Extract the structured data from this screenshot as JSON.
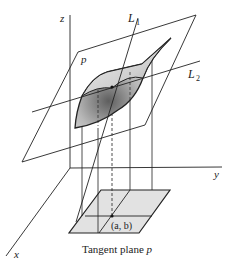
{
  "figure": {
    "title": "Tangent plane p",
    "caption_text": "Tangent plane ",
    "caption_var": "p",
    "labels": {
      "z_axis": "z",
      "y_axis": "y",
      "x_axis": "x",
      "plane": "p",
      "line1": "L",
      "line1_sub": "1",
      "line2": "L",
      "line2_sub": "2",
      "point": "(a, b)"
    },
    "colors": {
      "stroke": "#222222",
      "domain_fill": "#e2e2e2",
      "surface_dark": "#6a6a6a",
      "surface_light": "#f4f4f4"
    }
  }
}
